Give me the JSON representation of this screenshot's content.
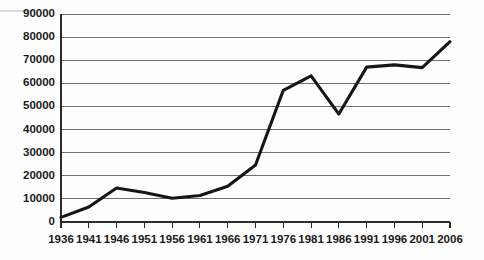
{
  "chart_data": {
    "type": "line",
    "title": "",
    "subtitle": "",
    "xlabel": "",
    "ylabel": "",
    "categories": [
      "1936",
      "1941",
      "1946",
      "1951",
      "1956",
      "1961",
      "1966",
      "1971",
      "1976",
      "1981",
      "1986",
      "1991",
      "1996",
      "2001",
      "2006"
    ],
    "x": [
      1936,
      1941,
      1946,
      1951,
      1956,
      1961,
      1966,
      1971,
      1976,
      1981,
      1986,
      1991,
      1996,
      2001,
      2006
    ],
    "values": [
      2000,
      6500,
      14700,
      12800,
      10300,
      11500,
      15500,
      24700,
      57000,
      63200,
      46700,
      67000,
      68000,
      66800,
      78000
    ],
    "series": [
      {
        "name": "",
        "values": [
          2000,
          6500,
          14700,
          12800,
          10300,
          11500,
          15500,
          24700,
          57000,
          63200,
          46700,
          67000,
          68000,
          66800,
          78000
        ],
        "color": "#161616"
      }
    ],
    "ylim": [
      0,
      90000
    ],
    "ytick_labels": [
      "0",
      "10000",
      "20000",
      "30000",
      "40000",
      "50000",
      "60000",
      "70000",
      "80000",
      "90000"
    ],
    "ytick_values": [
      0,
      10000,
      20000,
      30000,
      40000,
      50000,
      60000,
      70000,
      80000,
      90000
    ],
    "xtick_labels": [
      "1936",
      "1941",
      "1946",
      "1951",
      "1956",
      "1961",
      "1966",
      "1971",
      "1976",
      "1981",
      "1986",
      "1991",
      "1996",
      "2001",
      "2006"
    ],
    "grid": true,
    "grid_axis": "y",
    "legend": false,
    "legend_position": "none",
    "annotations": [],
    "colors": {
      "line": "#161616",
      "grid": "#6f6f6f",
      "axis": "#2b2b2b",
      "text": "#1a1a1a",
      "background": "#fefefe"
    }
  },
  "plot_geometry": {
    "left": 61,
    "right": 450,
    "top": 14,
    "bottom": 222
  }
}
